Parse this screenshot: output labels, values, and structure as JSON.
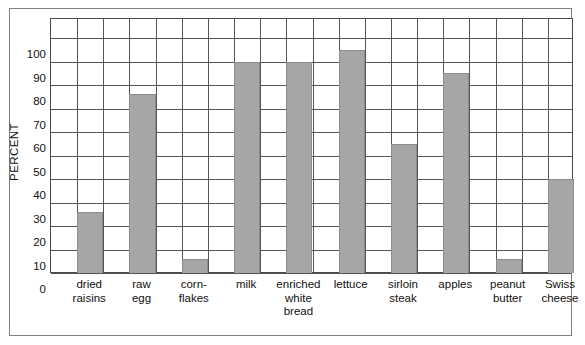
{
  "chart_data": {
    "type": "bar",
    "title": "",
    "xlabel": "",
    "ylabel": "PERCENT",
    "ylim": [
      0,
      100
    ],
    "yticks": [
      0,
      10,
      20,
      30,
      40,
      50,
      60,
      70,
      80,
      90,
      100
    ],
    "grid": true,
    "legend": "none",
    "bar_color": "#a6a6a6",
    "categories": [
      "dried raisins",
      "raw egg",
      "corn-flakes",
      "milk",
      "enriched white bread",
      "lettuce",
      "sirloin steak",
      "apples",
      "peanut butter",
      "Swiss cheese"
    ],
    "category_lines": [
      [
        "dried",
        "raisins"
      ],
      [
        "raw",
        "egg"
      ],
      [
        "corn-",
        "flakes"
      ],
      [
        "milk"
      ],
      [
        "enriched",
        "white",
        "bread"
      ],
      [
        "lettuce"
      ],
      [
        "sirloin",
        "steak"
      ],
      [
        "apples"
      ],
      [
        "peanut",
        "butter"
      ],
      [
        "Swiss",
        "cheese"
      ]
    ],
    "values": [
      26,
      76,
      6,
      90,
      90,
      95,
      55,
      85,
      6,
      40
    ]
  },
  "axis": {
    "y_title": "PERCENT",
    "y_tick_labels": [
      "100",
      "90",
      "80",
      "70",
      "60",
      "50",
      "40",
      "30",
      "20",
      "10",
      "0"
    ]
  }
}
